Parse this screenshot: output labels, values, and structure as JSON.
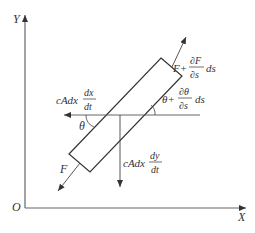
{
  "axes": {
    "y_label": "Y",
    "x_label": "X",
    "origin_label": "O"
  },
  "forces": {
    "upper_tension": {
      "base": "F+",
      "num": "∂F",
      "den": "∂s",
      "suffix": "ds"
    },
    "upper_angle": {
      "base": "θ+",
      "num": "∂θ",
      "den": "∂s",
      "suffix": "ds"
    },
    "horizontal_drag": {
      "prefix": "cAdx",
      "num": "dx",
      "den": "dt"
    },
    "vertical_drag": {
      "prefix": "cAdx",
      "num": "dy",
      "den": "dt"
    },
    "lower_tension": "F",
    "lower_angle": "θ"
  },
  "colors": {
    "line": "#333333",
    "axis": "#555555"
  }
}
